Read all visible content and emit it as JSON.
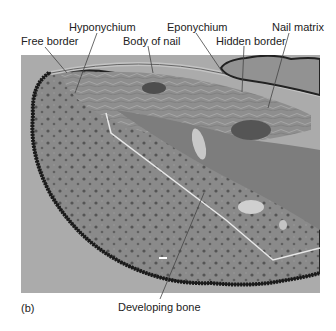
{
  "figure": {
    "panel_label": "(b)",
    "labels": [
      {
        "id": "hyponychium",
        "text": "Hyponychium"
      },
      {
        "id": "eponychium",
        "text": "Eponychium"
      },
      {
        "id": "nail-matrix",
        "text": "Nail matrix"
      },
      {
        "id": "free-border",
        "text": "Free border"
      },
      {
        "id": "body-of-nail",
        "text": "Body of nail"
      },
      {
        "id": "hidden-border",
        "text": "Hidden border"
      },
      {
        "id": "developing-bone",
        "text": "Developing bone"
      }
    ]
  }
}
